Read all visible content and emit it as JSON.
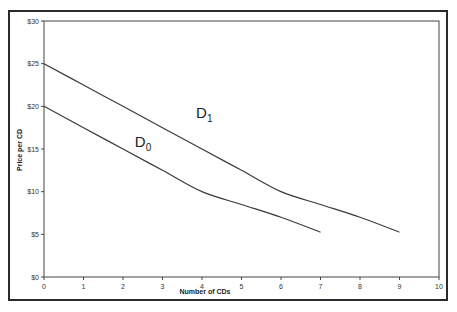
{
  "chart_data": {
    "type": "line",
    "title": "",
    "xlabel": "Number of CDs",
    "ylabel": "Price per CD",
    "xlim": [
      0,
      10
    ],
    "ylim": [
      0,
      30
    ],
    "x_ticks": [
      "0",
      "1",
      "2",
      "3",
      "4",
      "5",
      "6",
      "7",
      "8",
      "9",
      "10"
    ],
    "y_ticks": [
      "$0",
      "$5",
      "$10",
      "$15",
      "$20",
      "$25",
      "$30"
    ],
    "grid": false,
    "legend": "none (inline curve labels)",
    "series": [
      {
        "name": "D0",
        "label_main": "D",
        "label_sub": "0",
        "x": [
          0,
          1,
          2,
          3,
          4,
          5,
          6,
          7
        ],
        "values": [
          20,
          17.5,
          15,
          12.5,
          10,
          8.5,
          7,
          5.25
        ],
        "label_pos": [
          2.3,
          15.2
        ]
      },
      {
        "name": "D1",
        "label_main": "D",
        "label_sub": "1",
        "x": [
          0,
          1,
          2,
          3,
          4,
          5,
          6,
          7,
          8,
          9
        ],
        "values": [
          25,
          22.5,
          20,
          17.5,
          15,
          12.5,
          10,
          8.5,
          7,
          5.25
        ],
        "label_pos": [
          3.85,
          18.6
        ]
      }
    ]
  },
  "colors": {
    "line": "#3a3a3a",
    "frame": "#2a2a2a",
    "text": "#333333"
  }
}
